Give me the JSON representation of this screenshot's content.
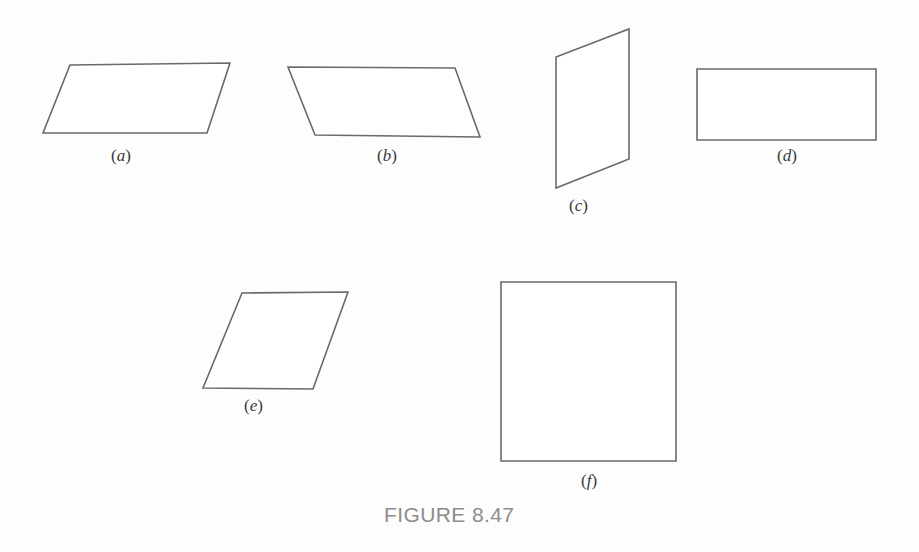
{
  "figure": {
    "caption": "FIGURE 8.47",
    "caption_position": {
      "x": 384,
      "y": 503
    },
    "background_color": "#fdfdfd",
    "stroke_color": "#6a6a6a",
    "stroke_width": 1.6,
    "fill_color": "#ffffff",
    "label_color": "#3a3a3a",
    "caption_color": "#8c8c8c"
  },
  "shapes": [
    {
      "id": "shape-a",
      "name": "parallelogram-a",
      "kind": "parallelogram",
      "label_open": "(",
      "label_letter": "a",
      "label_close": ")",
      "label_position": {
        "x": 111,
        "y": 146
      },
      "points": "70,65 230,63 207,133 43,133"
    },
    {
      "id": "shape-b",
      "name": "parallelogram-b",
      "kind": "parallelogram",
      "label_open": "(",
      "label_letter": "b",
      "label_close": ")",
      "label_position": {
        "x": 377,
        "y": 146
      },
      "points": "288,67 455,68 480,137 315,135"
    },
    {
      "id": "shape-c",
      "name": "parallelogram-c",
      "kind": "parallelogram",
      "label_open": "(",
      "label_letter": "c",
      "label_close": ")",
      "label_position": {
        "x": 569,
        "y": 196
      },
      "points": "629,29 629,159 556,188 556,57"
    },
    {
      "id": "shape-d",
      "name": "rectangle-d",
      "kind": "rectangle",
      "label_open": "(",
      "label_letter": "d",
      "label_close": ")",
      "label_position": {
        "x": 777,
        "y": 146
      },
      "points": "697,69 876,69 876,140 697,140"
    },
    {
      "id": "shape-e",
      "name": "rhombus-e",
      "kind": "rhombus",
      "label_open": "(",
      "label_letter": "e",
      "label_close": ")",
      "label_position": {
        "x": 244,
        "y": 396
      },
      "points": "242,293 348,292 313,389 203,388"
    },
    {
      "id": "shape-f",
      "name": "square-f",
      "kind": "square",
      "label_open": "(",
      "label_letter": "f",
      "label_close": ")",
      "label_position": {
        "x": 581,
        "y": 471
      },
      "points": "501,282 676,282 676,461 501,461"
    }
  ]
}
